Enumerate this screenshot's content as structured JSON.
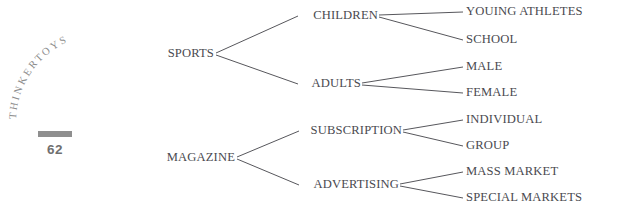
{
  "page": {
    "running_head": "THINKERTOYS",
    "running_head_letters": [
      "T",
      "H",
      "I",
      "N",
      "K",
      "E",
      "R",
      "T",
      "O",
      "Y",
      "S"
    ],
    "folio": "62",
    "background_color": "#ffffff",
    "text_color": "#4a4a50",
    "line_color": "#57575c",
    "folio_bar_color": "#8f8f8f",
    "running_head_color": "#8d8d8d"
  },
  "diagram": {
    "type": "tree",
    "orientation": "left-to-right",
    "roots": [
      {
        "label": "SPORTS",
        "children": [
          {
            "label": "CHILDREN",
            "children": [
              {
                "label": "YOUING ATHLETES"
              },
              {
                "label": "SCHOOL"
              }
            ]
          },
          {
            "label": "ADULTS",
            "children": [
              {
                "label": "MALE"
              },
              {
                "label": "FEMALE"
              }
            ]
          }
        ]
      },
      {
        "label": "MAGAZINE",
        "children": [
          {
            "label": "SUBSCRIPTION",
            "children": [
              {
                "label": "INDIVIDUAL"
              },
              {
                "label": "GROUP"
              }
            ]
          },
          {
            "label": "ADVERTISING",
            "children": [
              {
                "label": "MASS MARKET"
              },
              {
                "label": "SPECIAL MARKETS"
              }
            ]
          }
        ]
      }
    ]
  }
}
